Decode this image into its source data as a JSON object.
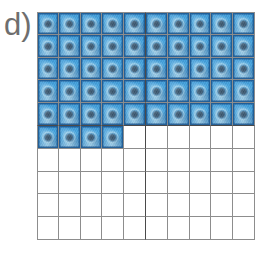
{
  "figure": {
    "panel_label": "d)",
    "label_color": "#6e6e6e",
    "background_color": "#ffffff"
  },
  "grid": {
    "columns": 10,
    "rows": 10,
    "total_cells": 100,
    "filled_cells": 54,
    "empty_cells": 46,
    "fill_fraction_text": "54/100",
    "gridline_color": "#8d8d8d",
    "quadrant_divider_color": "#4a4a4a",
    "quadrant_divider_after_column": 5,
    "quadrant_divider_after_row": 5,
    "filled_cell_color": "#3f9ad8",
    "filled_cell_border_color": "#1a548c",
    "filled_cell_nucleus_color": "#3a5064",
    "empty_cell_color": "#ffffff",
    "filled_counts_per_row": [
      10,
      10,
      10,
      10,
      10,
      4,
      0,
      0,
      0,
      0
    ],
    "cells": [
      [
        1,
        1,
        1,
        1,
        1,
        1,
        1,
        1,
        1,
        1
      ],
      [
        1,
        1,
        1,
        1,
        1,
        1,
        1,
        1,
        1,
        1
      ],
      [
        1,
        1,
        1,
        1,
        1,
        1,
        1,
        1,
        1,
        1
      ],
      [
        1,
        1,
        1,
        1,
        1,
        1,
        1,
        1,
        1,
        1
      ],
      [
        1,
        1,
        1,
        1,
        1,
        1,
        1,
        1,
        1,
        1
      ],
      [
        1,
        1,
        1,
        1,
        0,
        0,
        0,
        0,
        0,
        0
      ],
      [
        0,
        0,
        0,
        0,
        0,
        0,
        0,
        0,
        0,
        0
      ],
      [
        0,
        0,
        0,
        0,
        0,
        0,
        0,
        0,
        0,
        0
      ],
      [
        0,
        0,
        0,
        0,
        0,
        0,
        0,
        0,
        0,
        0
      ],
      [
        0,
        0,
        0,
        0,
        0,
        0,
        0,
        0,
        0,
        0
      ]
    ]
  },
  "chart_data": {
    "type": "heatmap",
    "title": "d)",
    "xlabel": "",
    "ylabel": "",
    "rows": 10,
    "columns": 10,
    "legend": [
      "filled = cell micrograph tile",
      "empty = blank square"
    ],
    "values": [
      [
        1,
        1,
        1,
        1,
        1,
        1,
        1,
        1,
        1,
        1
      ],
      [
        1,
        1,
        1,
        1,
        1,
        1,
        1,
        1,
        1,
        1
      ],
      [
        1,
        1,
        1,
        1,
        1,
        1,
        1,
        1,
        1,
        1
      ],
      [
        1,
        1,
        1,
        1,
        1,
        1,
        1,
        1,
        1,
        1
      ],
      [
        1,
        1,
        1,
        1,
        1,
        1,
        1,
        1,
        1,
        1
      ],
      [
        1,
        1,
        1,
        1,
        0,
        0,
        0,
        0,
        0,
        0
      ],
      [
        0,
        0,
        0,
        0,
        0,
        0,
        0,
        0,
        0,
        0
      ],
      [
        0,
        0,
        0,
        0,
        0,
        0,
        0,
        0,
        0,
        0
      ],
      [
        0,
        0,
        0,
        0,
        0,
        0,
        0,
        0,
        0,
        0
      ],
      [
        0,
        0,
        0,
        0,
        0,
        0,
        0,
        0,
        0,
        0
      ]
    ],
    "filled_total": 54,
    "grid": true,
    "legend_position": "none"
  }
}
